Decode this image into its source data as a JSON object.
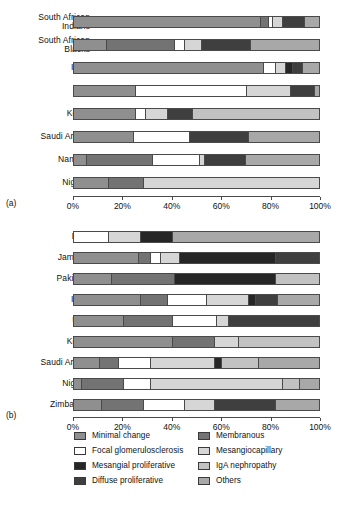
{
  "figure": {
    "panel_a_tag": "(a)",
    "panel_b_tag": "(b)"
  },
  "axis": {
    "ticks": [
      "0%",
      "20%",
      "40%",
      "60%",
      "80%",
      "100%"
    ],
    "tick_values": [
      0,
      20,
      40,
      60,
      80,
      100
    ],
    "min": 0,
    "max": 100
  },
  "legend": {
    "left": [
      {
        "label": "Minimal change",
        "color": "#8f8f8f"
      },
      {
        "label": "Focal glomerulosclerosis",
        "color": "#ffffff"
      },
      {
        "label": "Mesangial proliferative",
        "color": "#262626"
      },
      {
        "label": "Diffuse proliferative",
        "color": "#3f3f3f"
      }
    ],
    "right": [
      {
        "label": "Membranous",
        "color": "#737373"
      },
      {
        "label": "Mesangiocapillary",
        "color": "#d6d6d6"
      },
      {
        "label": "IgA nephropathy",
        "color": "#c2c2c2"
      },
      {
        "label": "Others",
        "color": "#a8a8a8"
      }
    ]
  },
  "colors": {
    "minimal_change": "#8f8f8f",
    "focal_glomerulosclerosis": "#ffffff",
    "mesangial_proliferative": "#262626",
    "diffuse_proliferative": "#3f3f3f",
    "membranous": "#737373",
    "mesangiocapillary": "#d6d6d6",
    "iga_nephropathy": "#c2c2c2",
    "others": "#a8a8a8",
    "outline": "#4a4a4a",
    "text": "#111111"
  },
  "chart_data": [
    {
      "type": "bar",
      "orientation": "horizontal",
      "stacked": true,
      "normalized": true,
      "panel": "(a)",
      "title": "",
      "xlabel": "",
      "ylabel": "",
      "xlim": [
        0,
        100
      ],
      "xticks": [
        0,
        20,
        40,
        60,
        80,
        100
      ],
      "xticklabels": [
        "0%",
        "20%",
        "40%",
        "60%",
        "80%",
        "100%"
      ],
      "grid": false,
      "legend_position": "below-figure",
      "categories": [
        "South African Indians",
        "South African Blacks",
        "India",
        "Iran",
        "Korea",
        "Saudi Arabia",
        "Namibia",
        "Nigeria"
      ],
      "series": [
        {
          "name": "Minimal change",
          "color": "#8f8f8f",
          "values": [
            76,
            13,
            77,
            25,
            25,
            24,
            5,
            14
          ]
        },
        {
          "name": "Membranous",
          "color": "#737373",
          "values": [
            3,
            28,
            0,
            0,
            0,
            0,
            27,
            14
          ]
        },
        {
          "name": "Focal glomerulosclerosis",
          "color": "#ffffff",
          "values": [
            2,
            4,
            5,
            45,
            4,
            23,
            19,
            0
          ]
        },
        {
          "name": "Mesangiocapillary",
          "color": "#d6d6d6",
          "values": [
            4,
            7,
            4,
            18,
            9,
            0,
            2,
            72
          ]
        },
        {
          "name": "Mesangial proliferative",
          "color": "#262626",
          "values": [
            0,
            0,
            3,
            0,
            0,
            0,
            0,
            0
          ]
        },
        {
          "name": "Diffuse proliferative",
          "color": "#3f3f3f",
          "values": [
            9,
            20,
            4,
            10,
            10,
            24,
            17,
            0
          ]
        },
        {
          "name": "IgA nephropathy",
          "color": "#c2c2c2",
          "values": [
            0,
            0,
            0,
            0,
            52,
            0,
            0,
            0
          ]
        },
        {
          "name": "Others",
          "color": "#a8a8a8",
          "values": [
            6,
            28,
            7,
            2,
            0,
            29,
            30,
            0
          ]
        }
      ]
    },
    {
      "type": "bar",
      "orientation": "horizontal",
      "stacked": true,
      "normalized": true,
      "panel": "(b)",
      "title": "",
      "xlabel": "",
      "ylabel": "",
      "xlim": [
        0,
        100
      ],
      "xticks": [
        0,
        20,
        40,
        60,
        80,
        100
      ],
      "xticklabels": [
        "0%",
        "20%",
        "40%",
        "60%",
        "80%",
        "100%"
      ],
      "grid": false,
      "legend_position": "below-figure",
      "categories": [
        "Peru",
        "Jamaica",
        "Pakistan",
        "India",
        "UAE",
        "Korea",
        "Saudi Arabia",
        "Nigeria",
        "Zimbabwe"
      ],
      "series": [
        {
          "name": "Minimal change",
          "color": "#8f8f8f",
          "values": [
            0,
            26,
            15,
            27,
            20,
            40,
            10,
            3,
            11
          ]
        },
        {
          "name": "Membranous",
          "color": "#737373",
          "values": [
            0,
            5,
            26,
            11,
            20,
            17,
            8,
            17,
            17
          ]
        },
        {
          "name": "Focal glomerulosclerosis",
          "color": "#ffffff",
          "values": [
            14,
            4,
            0,
            16,
            18,
            0,
            13,
            11,
            17
          ]
        },
        {
          "name": "Mesangiocapillary",
          "color": "#d6d6d6",
          "values": [
            13,
            8,
            0,
            17,
            5,
            10,
            26,
            54,
            12
          ]
        },
        {
          "name": "Mesangial proliferative",
          "color": "#262626",
          "values": [
            13,
            39,
            41,
            3,
            0,
            0,
            3,
            0,
            0
          ]
        },
        {
          "name": "Diffuse proliferative",
          "color": "#3f3f3f",
          "values": [
            0,
            18,
            0,
            9,
            37,
            0,
            0,
            0,
            25
          ]
        },
        {
          "name": "IgA nephropathy",
          "color": "#c2c2c2",
          "values": [
            0,
            0,
            18,
            0,
            0,
            33,
            15,
            7,
            0
          ]
        },
        {
          "name": "Others",
          "color": "#a8a8a8",
          "values": [
            60,
            0,
            0,
            17,
            0,
            0,
            25,
            8,
            18
          ]
        }
      ]
    }
  ]
}
